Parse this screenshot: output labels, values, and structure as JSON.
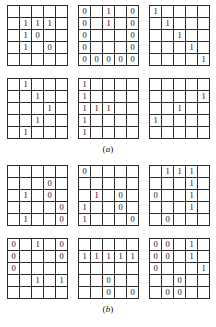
{
  "figure": {
    "sections": [
      {
        "id": "section-a",
        "caption_open": "(",
        "caption_letter": "a",
        "caption_close": ")",
        "rows": [
          {
            "grids": [
              {
                "name": "grid-a1",
                "cells": [
                  [
                    "",
                    "",
                    "",
                    "",
                    ""
                  ],
                  [
                    "",
                    "1",
                    "1",
                    "1",
                    ""
                  ],
                  [
                    "",
                    "1",
                    "0",
                    "",
                    ""
                  ],
                  [
                    "",
                    "1",
                    "",
                    "0",
                    ""
                  ],
                  [
                    "",
                    "",
                    "",
                    "",
                    ""
                  ]
                ]
              },
              {
                "name": "grid-a2",
                "cells": [
                  [
                    "0",
                    "",
                    "1",
                    "",
                    "0"
                  ],
                  [
                    "0",
                    "",
                    "1",
                    "",
                    "0"
                  ],
                  [
                    "0",
                    "",
                    "",
                    "",
                    "0"
                  ],
                  [
                    "0",
                    "",
                    "",
                    "",
                    "0"
                  ],
                  [
                    "0",
                    "0",
                    "0",
                    "0",
                    "0"
                  ]
                ]
              },
              {
                "name": "grid-a3",
                "cells": [
                  [
                    "1",
                    "",
                    "",
                    "",
                    ""
                  ],
                  [
                    "",
                    "1",
                    "",
                    "",
                    ""
                  ],
                  [
                    "",
                    "",
                    "1",
                    "",
                    ""
                  ],
                  [
                    "",
                    "",
                    "",
                    "1",
                    ""
                  ],
                  [
                    "",
                    "",
                    "",
                    "",
                    "1"
                  ]
                ]
              }
            ]
          },
          {
            "grids": [
              {
                "name": "grid-a4",
                "cells": [
                  [
                    "",
                    "1",
                    "",
                    "",
                    ""
                  ],
                  [
                    "",
                    "",
                    "1",
                    "",
                    ""
                  ],
                  [
                    "",
                    "",
                    "",
                    "1",
                    ""
                  ],
                  [
                    "",
                    "",
                    "1",
                    "",
                    ""
                  ],
                  [
                    "",
                    "1",
                    "",
                    "",
                    ""
                  ]
                ]
              },
              {
                "name": "grid-a5",
                "cells": [
                  [
                    "1",
                    "",
                    "",
                    "",
                    ""
                  ],
                  [
                    "1",
                    "",
                    "",
                    "",
                    ""
                  ],
                  [
                    "1",
                    "1",
                    "1",
                    "",
                    ""
                  ],
                  [
                    "1",
                    "",
                    "",
                    "",
                    ""
                  ],
                  [
                    "1",
                    "",
                    "",
                    "",
                    ""
                  ]
                ]
              },
              {
                "name": "grid-a6",
                "cells": [
                  [
                    "",
                    "",
                    "",
                    "",
                    ""
                  ],
                  [
                    "",
                    "",
                    "",
                    "",
                    "1"
                  ],
                  [
                    "",
                    "",
                    "1",
                    "",
                    ""
                  ],
                  [
                    "1",
                    "",
                    "",
                    "",
                    ""
                  ],
                  [
                    "",
                    "",
                    "",
                    "",
                    ""
                  ]
                ]
              }
            ]
          }
        ]
      },
      {
        "id": "section-b",
        "caption_open": "(",
        "caption_letter": "b",
        "caption_close": ")",
        "rows": [
          {
            "grids": [
              {
                "name": "grid-b1",
                "cells": [
                  [
                    "",
                    "",
                    "",
                    "",
                    ""
                  ],
                  [
                    "",
                    "",
                    "",
                    "0",
                    ""
                  ],
                  [
                    "",
                    "1",
                    "",
                    "0",
                    ""
                  ],
                  [
                    "",
                    "",
                    "",
                    "",
                    "0"
                  ],
                  [
                    "",
                    "1",
                    "",
                    "",
                    "0"
                  ]
                ]
              },
              {
                "name": "grid-b2",
                "cells": [
                  [
                    "0",
                    "",
                    "",
                    "",
                    ""
                  ],
                  [
                    "",
                    "",
                    "",
                    "",
                    ""
                  ],
                  [
                    "",
                    "1",
                    "",
                    "0",
                    ""
                  ],
                  [
                    "1",
                    "",
                    "",
                    "0",
                    ""
                  ],
                  [
                    "1",
                    "",
                    "",
                    "",
                    "0"
                  ]
                ]
              },
              {
                "name": "grid-b3",
                "cells": [
                  [
                    "",
                    "1",
                    "1",
                    "1",
                    ""
                  ],
                  [
                    "",
                    "",
                    "",
                    "1",
                    ""
                  ],
                  [
                    "0",
                    "",
                    "",
                    "1",
                    ""
                  ],
                  [
                    "",
                    "",
                    "",
                    "1",
                    ""
                  ],
                  [
                    "",
                    "0",
                    "",
                    "",
                    ""
                  ]
                ]
              }
            ]
          },
          {
            "grids": [
              {
                "name": "grid-b4",
                "cells": [
                  [
                    "0",
                    "",
                    "1",
                    "",
                    "0"
                  ],
                  [
                    "0",
                    "",
                    "",
                    "",
                    "0"
                  ],
                  [
                    "0",
                    "",
                    "",
                    "",
                    ""
                  ],
                  [
                    "",
                    "",
                    "1",
                    "",
                    "1"
                  ],
                  [
                    "",
                    "",
                    "",
                    "",
                    ""
                  ]
                ]
              },
              {
                "name": "grid-b5",
                "cells": [
                  [
                    "",
                    "",
                    "",
                    "",
                    ""
                  ],
                  [
                    "1",
                    "1",
                    "1",
                    "1",
                    "1"
                  ],
                  [
                    "",
                    "",
                    "",
                    "",
                    ""
                  ],
                  [
                    "",
                    "",
                    "0",
                    "",
                    ""
                  ],
                  [
                    "",
                    "",
                    "0",
                    "",
                    "0"
                  ]
                ]
              },
              {
                "name": "grid-b6",
                "cells": [
                  [
                    "0",
                    "0",
                    "",
                    "1",
                    ""
                  ],
                  [
                    "0",
                    "0",
                    "",
                    "1",
                    ""
                  ],
                  [
                    "0",
                    "",
                    "",
                    "",
                    "1"
                  ],
                  [
                    "",
                    "",
                    "0",
                    "",
                    ""
                  ],
                  [
                    "",
                    "0",
                    "0",
                    "",
                    ""
                  ]
                ]
              }
            ]
          }
        ]
      }
    ]
  }
}
